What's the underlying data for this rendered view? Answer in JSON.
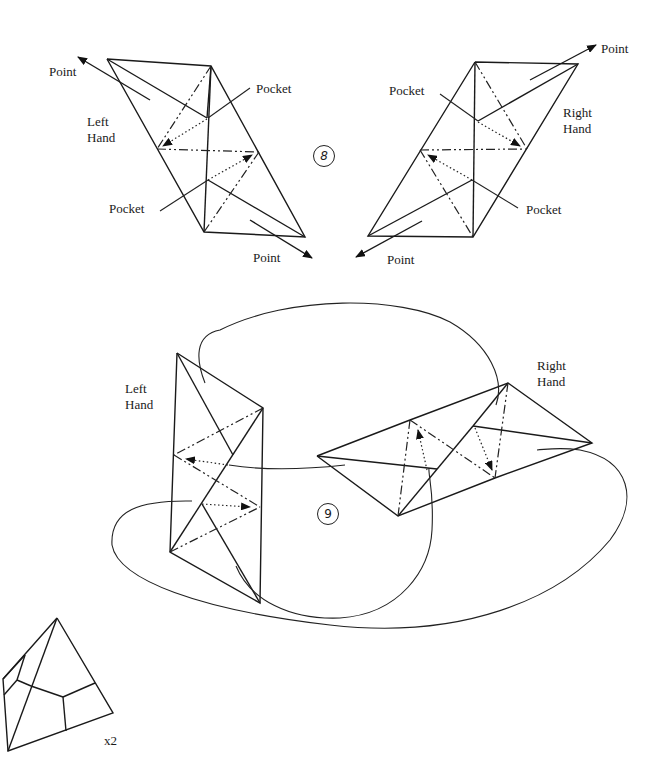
{
  "step8": {
    "number": "8",
    "left_figure": {
      "hand_label": "Left\nHand",
      "point_top": "Point",
      "point_bottom": "Point",
      "pocket_top": "Pocket",
      "pocket_bottom": "Pocket"
    },
    "right_figure": {
      "hand_label": "Right\nHand",
      "point_top": "Point",
      "point_bottom": "Point",
      "pocket_top": "Pocket",
      "pocket_bottom": "Pocket"
    }
  },
  "step9": {
    "number": "9",
    "left_label": "Left\nHand",
    "right_label": "Right\nHand"
  },
  "result": {
    "multiplier": "x2"
  }
}
